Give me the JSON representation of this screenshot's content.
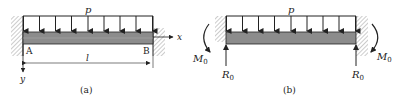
{
  "figure_a": {
    "caption": "(a)",
    "load_label": "p",
    "point_a": "A",
    "point_b": "B",
    "length_label": "l",
    "x_axis_label": "x",
    "y_axis_label": "y"
  },
  "figure_b": {
    "caption": "(b)",
    "load_label": "p",
    "reaction_left": "R",
    "reaction_left_sub": "0",
    "reaction_right": "R",
    "reaction_right_sub": "0",
    "moment_left": "M",
    "moment_left_sub": "0",
    "moment_right": "M",
    "moment_right_sub": "0"
  },
  "colors": {
    "beam_fill": "#8c8c8c",
    "line": "#222222",
    "hatch": "#9a9a9a"
  }
}
